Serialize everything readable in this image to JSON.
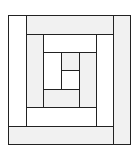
{
  "diagram": {
    "type": "log-cabin-quilt-block",
    "width": 139,
    "height": 157,
    "colors": {
      "light": "#f1f1f1",
      "white": "#ffffff",
      "line": "#222222"
    },
    "pieces": [
      {
        "name": "outer-left-strip",
        "x": 8,
        "y": 15,
        "w": 18,
        "h": 111,
        "fill": "white"
      },
      {
        "name": "outer-top-strip",
        "x": 26,
        "y": 15,
        "w": 87,
        "h": 19,
        "fill": "light"
      },
      {
        "name": "outer-right-strip",
        "x": 113,
        "y": 15,
        "w": 17,
        "h": 129,
        "fill": "light"
      },
      {
        "name": "outer-bottom-strip",
        "x": 8,
        "y": 126,
        "w": 105,
        "h": 18,
        "fill": "light"
      },
      {
        "name": "ring2-left-strip",
        "x": 26,
        "y": 34,
        "w": 17,
        "h": 73,
        "fill": "light"
      },
      {
        "name": "ring2-top-strip",
        "x": 43,
        "y": 34,
        "w": 53,
        "h": 18,
        "fill": "white"
      },
      {
        "name": "ring2-right-strip",
        "x": 96,
        "y": 34,
        "w": 17,
        "h": 92,
        "fill": "white"
      },
      {
        "name": "ring2-bottom-strip",
        "x": 26,
        "y": 107,
        "w": 70,
        "h": 19,
        "fill": "white"
      },
      {
        "name": "ring3-left-strip",
        "x": 43,
        "y": 52,
        "w": 18,
        "h": 37,
        "fill": "white"
      },
      {
        "name": "ring3-right-strip",
        "x": 79,
        "y": 52,
        "w": 17,
        "h": 55,
        "fill": "light"
      },
      {
        "name": "ring3-bottom-strip",
        "x": 43,
        "y": 89,
        "w": 36,
        "h": 18,
        "fill": "light"
      },
      {
        "name": "center-top-square",
        "x": 61,
        "y": 52,
        "w": 18,
        "h": 18,
        "fill": "light"
      },
      {
        "name": "center-bottom-square",
        "x": 61,
        "y": 70,
        "w": 18,
        "h": 19,
        "fill": "white"
      }
    ]
  }
}
